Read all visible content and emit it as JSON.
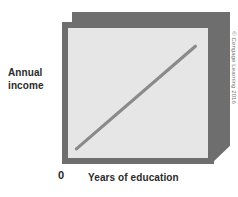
{
  "figure": {
    "y_axis_label_line1": "Annual",
    "y_axis_label_line2": "income",
    "x_axis_label": "Years of education",
    "origin_label": "0",
    "credit": "© Cengage Learning 2016"
  },
  "colors": {
    "frame": "#6e6e6e",
    "plot_background": "#e6e6e6",
    "trend_line": "#8a8a8a",
    "label_text": "#2b2b2b",
    "credit_text": "#777777",
    "page_background": "#ffffff"
  },
  "chart_data": {
    "type": "line",
    "title": "",
    "subtitle": "",
    "xlabel": "Years of education",
    "ylabel": "Annual income",
    "xlim": [
      0,
      10
    ],
    "ylim": [
      0,
      10
    ],
    "grid": false,
    "legend": false,
    "legend_position": "none",
    "xticks": [
      "0"
    ],
    "yticks": [],
    "annotations": [
      "© Cengage Learning 2016"
    ],
    "series": [
      {
        "name": "Annual income vs. years of education",
        "style": "straight-line",
        "relationship": "positive",
        "x": [
          0.6,
          9.1
        ],
        "y": [
          0.7,
          8.6
        ]
      }
    ]
  }
}
